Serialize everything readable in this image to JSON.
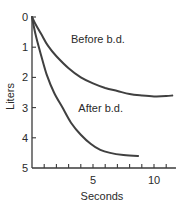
{
  "chart_data": {
    "type": "line",
    "title": "",
    "xlabel": "Seconds",
    "ylabel": "Liters",
    "xlim": [
      0,
      11.8
    ],
    "ylim": [
      0,
      5
    ],
    "y_inverted": true,
    "grid": false,
    "legend": "inline labels",
    "x_ticks": [
      5,
      10
    ],
    "x_minor_tick_step": 1,
    "y_ticks": [
      0,
      1,
      2,
      3,
      4,
      5
    ],
    "series": [
      {
        "name": "Before b.d.",
        "label_position": {
          "x": 3.2,
          "y": 0.85
        },
        "points": [
          [
            0,
            0
          ],
          [
            0.3,
            0.25
          ],
          [
            0.8,
            0.6
          ],
          [
            1.3,
            0.95
          ],
          [
            2,
            1.3
          ],
          [
            3,
            1.7
          ],
          [
            4,
            2.0
          ],
          [
            5,
            2.2
          ],
          [
            6,
            2.35
          ],
          [
            7,
            2.45
          ],
          [
            8,
            2.55
          ],
          [
            9,
            2.6
          ],
          [
            10,
            2.63
          ],
          [
            11,
            2.62
          ],
          [
            11.5,
            2.6
          ]
        ]
      },
      {
        "name": "After b.d.",
        "label_position": {
          "x": 3.8,
          "y": 3.15
        },
        "points": [
          [
            0,
            0
          ],
          [
            0.3,
            0.6
          ],
          [
            0.7,
            1.2
          ],
          [
            1.2,
            1.9
          ],
          [
            1.8,
            2.5
          ],
          [
            2.5,
            3.0
          ],
          [
            3.2,
            3.5
          ],
          [
            4,
            3.9
          ],
          [
            4.8,
            4.2
          ],
          [
            5.6,
            4.4
          ],
          [
            6.4,
            4.5
          ],
          [
            7.5,
            4.57
          ],
          [
            8.7,
            4.6
          ]
        ]
      }
    ]
  }
}
